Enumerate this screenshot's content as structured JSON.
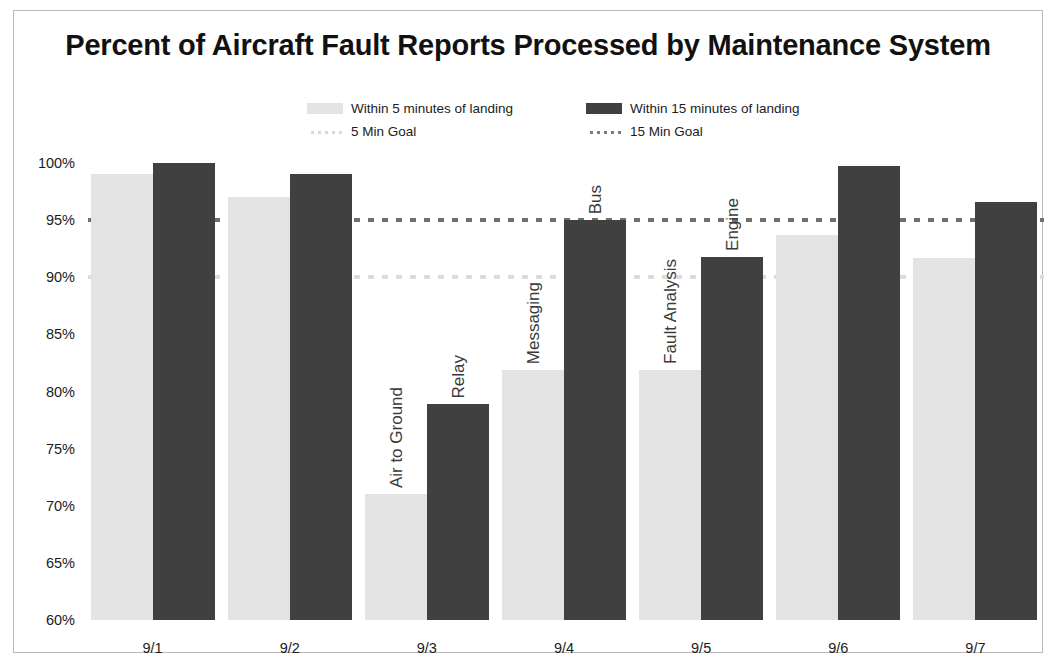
{
  "chart_data": {
    "type": "bar",
    "title": "Percent of Aircraft Fault Reports Processed by Maintenance System",
    "xlabel": "",
    "ylabel": "",
    "ylim": [
      60,
      100
    ],
    "ytick_labels": [
      "100%",
      "95%",
      "90%",
      "85%",
      "80%",
      "75%",
      "70%",
      "65%",
      "60%"
    ],
    "ytick_values": [
      100,
      95,
      90,
      85,
      80,
      75,
      70,
      65,
      60
    ],
    "grid": false,
    "legend_position": "top-center",
    "categories": [
      "9/1",
      "9/2",
      "9/3",
      "9/4",
      "9/5",
      "9/6",
      "9/7"
    ],
    "series": [
      {
        "name": "Within 5 minutes of landing",
        "color": "#e3e3e3",
        "values": [
          99.0,
          97.0,
          71.0,
          81.9,
          81.9,
          93.7,
          91.7
        ]
      },
      {
        "name": "Within 15 minutes of landing",
        "color": "#404040",
        "values": [
          100.0,
          99.0,
          78.9,
          95.0,
          91.8,
          99.7,
          96.6
        ]
      }
    ],
    "reference_lines": [
      {
        "name": "5 Min Goal",
        "value": 90,
        "color": "#dcdcdc",
        "style": "dotted"
      },
      {
        "name": "15 Min Goal",
        "value": 95,
        "color": "#6f6f6f",
        "style": "dotted"
      }
    ],
    "annotations": [
      {
        "text": "Air to Ground",
        "category": "9/3",
        "series": "Within 5 minutes of landing"
      },
      {
        "text": "Relay",
        "category": "9/3",
        "series": "Within 15 minutes of landing"
      },
      {
        "text": "Messaging",
        "category": "9/4",
        "series": "Within 5 minutes of landing"
      },
      {
        "text": "Bus",
        "category": "9/4",
        "series": "Within 15 minutes of landing"
      },
      {
        "text": "Fault Analysis",
        "category": "9/5",
        "series": "Within 5 minutes of landing"
      },
      {
        "text": "Engine",
        "category": "9/5",
        "series": "Within 15 minutes of landing"
      }
    ]
  },
  "legend": {
    "items": [
      {
        "label": "Within 5 minutes of landing",
        "marker": "bar-light-swatch"
      },
      {
        "label": "Within 15 minutes of landing",
        "marker": "bar-dark-swatch"
      },
      {
        "label": "5 Min Goal",
        "marker": "dotted-line-light-swatch"
      },
      {
        "label": "15 Min Goal",
        "marker": "dotted-line-dark-swatch"
      }
    ]
  }
}
